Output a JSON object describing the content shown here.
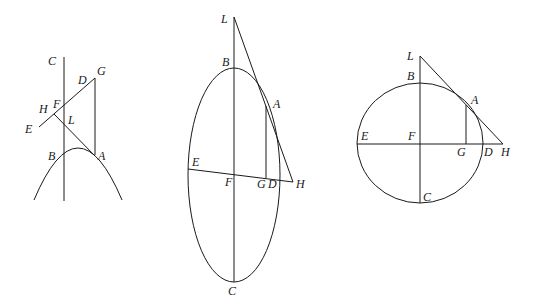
{
  "figures": [
    {
      "name": "parabola",
      "labels": {
        "C": "C",
        "G": "G",
        "D": "D",
        "F": "F",
        "H": "H",
        "E": "E",
        "L": "L",
        "B": "B",
        "A": "A"
      }
    },
    {
      "name": "ellipse",
      "labels": {
        "L": "L",
        "B": "B",
        "A": "A",
        "E": "E",
        "F": "F",
        "G": "G",
        "D": "D",
        "H": "H",
        "C": "C"
      }
    },
    {
      "name": "circle",
      "labels": {
        "L": "L",
        "B": "B",
        "A": "A",
        "E": "E",
        "F": "F",
        "G": "G",
        "D": "D",
        "H": "H",
        "C": "C"
      }
    }
  ]
}
